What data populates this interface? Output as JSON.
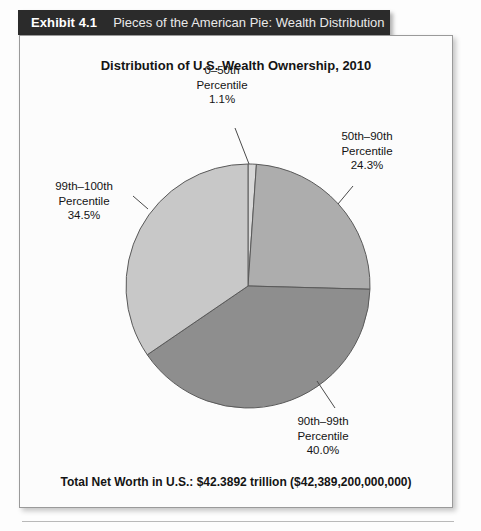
{
  "header": {
    "exhibit_number": "Exhibit 4.1",
    "exhibit_title": "Pieces of the American Pie: Wealth Distribution",
    "bar_color": "#2b2b2b",
    "text_color": "#ffffff"
  },
  "footer": {
    "note": "Total Net Worth in U.S.: $42.3892 trillion ($42,389,200,000,000)"
  },
  "labels": {
    "p0_50": "0–50th\nPercentile\n1.1%",
    "p50_90": "50th–90th\nPercentile\n24.3%",
    "p99_100": "99th–100th\nPercentile\n34.5%",
    "p90_99": "90th–99th\nPercentile\n40.0%"
  },
  "chart_data": {
    "type": "pie",
    "title": "Distribution of U.S. Wealth Ownership, 2010",
    "subtitle": "",
    "xlabel": "",
    "ylabel": "",
    "legend_position": "none",
    "grid": false,
    "start_angle_deg": 0,
    "direction": "clockwise",
    "total_net_worth_label": "Total Net Worth in U.S.: $42.3892 trillion ($42,389,200,000,000)",
    "total_net_worth_trillions": 42.3892,
    "total_net_worth_dollars": 42389200000000,
    "categories": [
      "0–50th Percentile",
      "50th–90th Percentile",
      "90th–99th Percentile",
      "99th–100th Percentile"
    ],
    "values": [
      1.1,
      24.3,
      40.0,
      34.5
    ],
    "value_labels": [
      "1.1%",
      "24.3%",
      "40.0%",
      "34.5%"
    ],
    "colors": [
      "#d8d8d8",
      "#adadad",
      "#8e8e8e",
      "#c8c8c8"
    ],
    "slice_edge_color": "#5a5a5a",
    "center_x": 228,
    "center_y": 250,
    "radius": 122
  }
}
